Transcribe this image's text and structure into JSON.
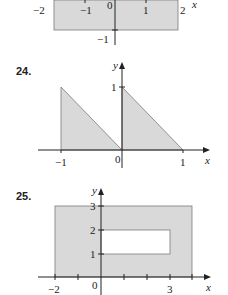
{
  "colors": {
    "shade": "#d9d9d9",
    "axis": "#222222",
    "edge": "#7a7a7a"
  },
  "figures": [
    {
      "id": "23-partial",
      "x_ticks": [
        "−2",
        "−1",
        "0",
        "1",
        "2"
      ],
      "y_ticks": [
        "−1"
      ],
      "x_axis_label": "x"
    },
    {
      "number": "24.",
      "x_ticks": [
        "−1",
        "0",
        "1"
      ],
      "y_ticks": [
        "1"
      ],
      "x_axis_label": "x",
      "y_axis_label": "y"
    },
    {
      "number": "25.",
      "x_ticks": [
        "−2",
        "0",
        "3"
      ],
      "y_ticks": [
        "1",
        "2",
        "3"
      ],
      "x_axis_label": "x",
      "y_axis_label": "y"
    }
  ]
}
